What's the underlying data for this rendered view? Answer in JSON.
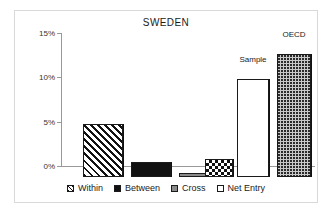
{
  "chart_data": {
    "type": "bar",
    "title": "SWEDEN",
    "xlabel": "",
    "ylabel": "",
    "ylim": [
      0,
      15
    ],
    "ytick_labels": [
      "0%",
      "5%",
      "10%",
      "15%"
    ],
    "ytick_values": [
      0,
      5,
      10,
      15
    ],
    "grid": false,
    "legend_position": "bottom",
    "categories": [
      "Within",
      "Between",
      "Cross",
      "Net Entry",
      "Sample",
      "OECD"
    ],
    "values": [
      6.0,
      1.7,
      0.4,
      2.0,
      11.0,
      13.9
    ],
    "value_suffix": "%",
    "series": [
      {
        "name": "Decomposition",
        "values": [
          6.0,
          1.7,
          0.4,
          2.0,
          11.0,
          13.9
        ]
      }
    ],
    "bars": [
      {
        "category": "Within",
        "value": 6.0,
        "fill": "fill-hatch",
        "data_label": ""
      },
      {
        "category": "Between",
        "value": 1.7,
        "fill": "fill-solid",
        "data_label": ""
      },
      {
        "category": "Cross",
        "value": 0.4,
        "fill": "fill-gray",
        "data_label": ""
      },
      {
        "category": "Net Entry",
        "value": 2.0,
        "fill": "fill-check",
        "data_label": ""
      },
      {
        "category": "Sample",
        "value": 11.0,
        "fill": "fill-white",
        "data_label": "Sample"
      },
      {
        "category": "OECD",
        "value": 13.9,
        "fill": "fill-dots",
        "data_label": "OECD"
      }
    ],
    "annotations": [
      {
        "text": "Sample",
        "target": "Sample"
      },
      {
        "text": "OECD",
        "target": "OECD"
      }
    ],
    "legend": [
      {
        "label": "Within",
        "fill": "fill-hatch"
      },
      {
        "label": "Between",
        "fill": "fill-solid"
      },
      {
        "label": "Cross",
        "fill": "fill-gray"
      },
      {
        "label": "Net Entry",
        "fill": "fill-white"
      }
    ],
    "colors": {
      "axis": "#999999",
      "text": "#1a1a1a",
      "bar_outline": "#1a1a1a",
      "gray_fill": "#8a8a8a",
      "dots_fill": "#c9c9c9",
      "frame_border": "#d9d9d9",
      "background": "#ffffff"
    }
  }
}
